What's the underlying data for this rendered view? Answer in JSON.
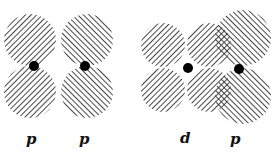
{
  "diagram": {
    "left_pair": {
      "labels": [
        "p",
        "p"
      ]
    },
    "right_pair": {
      "labels": [
        "d",
        "p"
      ]
    }
  }
}
